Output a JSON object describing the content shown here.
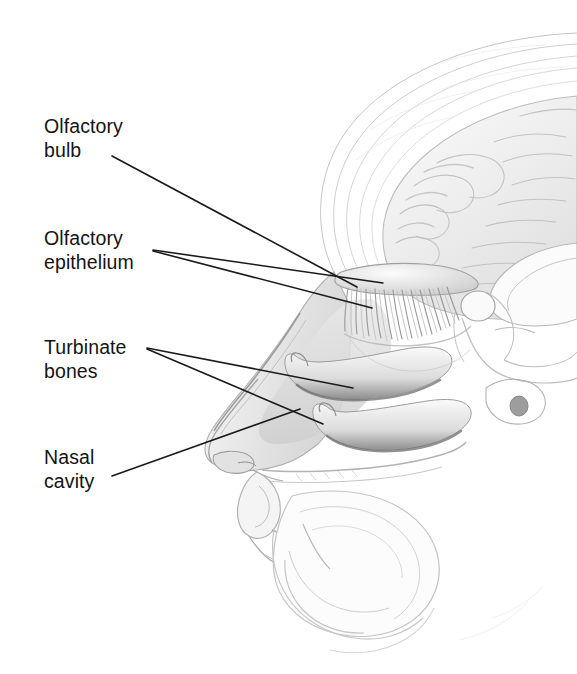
{
  "figure": {
    "width": 577,
    "height": 674,
    "background_color": "#ffffff",
    "style": "pencil illustration, grayscale"
  },
  "labels": [
    {
      "id": "olfactory-bulb",
      "text": "Olfactory\nbulb",
      "line1": "Olfactory",
      "line2": "bulb",
      "x": 44,
      "y": 115
    },
    {
      "id": "olfactory-epithelium",
      "text": "Olfactory\nepithelium",
      "line1": "Olfactory",
      "line2": "epithelium",
      "x": 44,
      "y": 227
    },
    {
      "id": "turbinate-bones",
      "text": "Turbinate\nbones",
      "line1": "Turbinate",
      "line2": "bones",
      "x": 44,
      "y": 336
    },
    {
      "id": "nasal-cavity",
      "text": "Nasal\ncavity",
      "line1": "Nasal",
      "line2": "cavity",
      "x": 44,
      "y": 446
    }
  ],
  "leader_lines": [
    {
      "id": "leader-olfactory-bulb",
      "from": [
        112,
        156
      ],
      "to": [
        357,
        287
      ],
      "label": "olfactory-bulb"
    },
    {
      "id": "leader-olfactory-epithelium-upper",
      "from": [
        153,
        250
      ],
      "to": [
        383,
        283
      ],
      "label": "olfactory-epithelium"
    },
    {
      "id": "leader-olfactory-epithelium-lower",
      "from": [
        153,
        251
      ],
      "to": [
        372,
        308
      ],
      "label": "olfactory-epithelium"
    },
    {
      "id": "leader-turbinate-upper",
      "from": [
        147,
        348
      ],
      "to": [
        353,
        388
      ],
      "label": "turbinate-bones"
    },
    {
      "id": "leader-turbinate-lower",
      "from": [
        147,
        349
      ],
      "to": [
        323,
        424
      ],
      "label": "turbinate-bones"
    },
    {
      "id": "leader-nasal-cavity",
      "from": [
        112,
        476
      ],
      "to": [
        300,
        409
      ],
      "label": "nasal-cavity"
    }
  ],
  "anatomy_features": [
    {
      "id": "cerebrum",
      "name": "cerebrum with gyri and sulci"
    },
    {
      "id": "skull-scalp",
      "name": "scalp and skull outline"
    },
    {
      "id": "olfactory-bulb-structure",
      "name": "olfactory bulb with nerve fibers"
    },
    {
      "id": "superior-turbinate",
      "name": "superior turbinate shelf"
    },
    {
      "id": "inferior-turbinate",
      "name": "inferior turbinate shelf"
    },
    {
      "id": "nose-profile",
      "name": "external nose profile"
    },
    {
      "id": "nasal-airway",
      "name": "nasal cavity airway"
    },
    {
      "id": "corpus-callosum",
      "name": "corpus callosum"
    },
    {
      "id": "brainstem",
      "name": "brainstem and pons"
    },
    {
      "id": "lips",
      "name": "upper and lower lips"
    },
    {
      "id": "tongue",
      "name": "tongue"
    },
    {
      "id": "hard-palate",
      "name": "hard palate"
    },
    {
      "id": "chin",
      "name": "chin and jaw"
    }
  ],
  "colors": {
    "line": "#1a1a1a",
    "text": "#141414",
    "background": "#ffffff",
    "tissue_light": "#f2f2f2",
    "tissue_mid": "#d8d8d8",
    "tissue_dark": "#a8a8a8",
    "shadow": "#777777"
  }
}
